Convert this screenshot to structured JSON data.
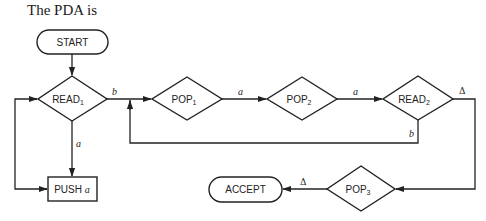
{
  "intro_text": "The PDA is",
  "nodes": {
    "start": {
      "label": "START",
      "shape": "rounded-rect"
    },
    "read1": {
      "label": "READ",
      "sub": "1",
      "shape": "diamond"
    },
    "pop1": {
      "label": "POP",
      "sub": "1",
      "shape": "diamond"
    },
    "pop2": {
      "label": "POP",
      "sub": "2",
      "shape": "diamond"
    },
    "read2": {
      "label": "READ",
      "sub": "2",
      "shape": "diamond"
    },
    "push_a": {
      "label": "PUSH",
      "arg": "a",
      "shape": "rect"
    },
    "pop3": {
      "label": "POP",
      "sub": "3",
      "shape": "diamond"
    },
    "accept": {
      "label": "ACCEPT",
      "shape": "rounded-rect"
    }
  },
  "edges": [
    {
      "from": "start",
      "to": "read1",
      "label": ""
    },
    {
      "from": "read1",
      "to": "pop1",
      "label": "b"
    },
    {
      "from": "read1",
      "to": "push_a",
      "label": "a"
    },
    {
      "from": "push_a",
      "to": "read1",
      "label": ""
    },
    {
      "from": "pop1",
      "to": "pop2",
      "label": "a"
    },
    {
      "from": "pop2",
      "to": "read2",
      "label": "a"
    },
    {
      "from": "read2",
      "to": "pop1",
      "label": "b"
    },
    {
      "from": "read2",
      "to": "pop3",
      "label": "Δ"
    },
    {
      "from": "pop3",
      "to": "accept",
      "label": "Δ"
    }
  ],
  "colors": {
    "ink": "#222222",
    "background": "#ffffff"
  }
}
